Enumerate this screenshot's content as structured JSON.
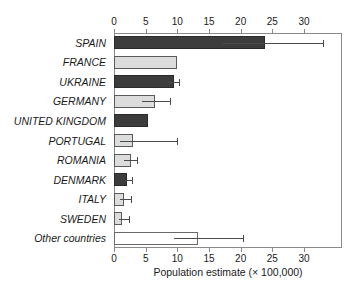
{
  "chart_data": {
    "type": "bar",
    "orientation": "horizontal",
    "title": "",
    "xlabel": "Population estimate (× 100,000)",
    "ylabel": "",
    "xlim": [
      0,
      36
    ],
    "xticks": [
      0,
      5,
      10,
      15,
      20,
      25,
      30
    ],
    "xtick_labels": [
      "0",
      "5",
      "10",
      "15",
      "20",
      "25",
      "30"
    ],
    "grid": false,
    "legend": "none",
    "axis_top": true,
    "axis_bottom": true,
    "categories": [
      "SPAIN",
      "FRANCE",
      "UKRAINE",
      "GERMANY",
      "UNITED KINGDOM",
      "PORTUGAL",
      "ROMANIA",
      "DENMARK",
      "ITALY",
      "SWEDEN",
      "Other countries"
    ],
    "values": [
      23.9,
      9.9,
      9.5,
      6.4,
      5.4,
      3.0,
      2.7,
      2.1,
      1.6,
      1.3,
      13.3
    ],
    "error_low": [
      17.0,
      null,
      8.6,
      4.4,
      null,
      1.0,
      1.6,
      1.7,
      0.9,
      0.8,
      9.5
    ],
    "error_high": [
      33.0,
      null,
      10.2,
      8.9,
      null,
      9.9,
      3.6,
      2.9,
      2.7,
      2.4,
      20.3
    ],
    "fills": [
      "dark",
      "light",
      "dark",
      "light",
      "dark",
      "light",
      "light",
      "dark",
      "light",
      "light",
      "white"
    ],
    "colors": {
      "dark": "#3c3c3c",
      "light": "#dcdcdc",
      "white": "#ffffff",
      "outline": "#4a4a4a",
      "axis": "#8a8a8a",
      "error": "#4a4a4a",
      "text": "#1a1a1a",
      "background": "#ffffff"
    }
  }
}
